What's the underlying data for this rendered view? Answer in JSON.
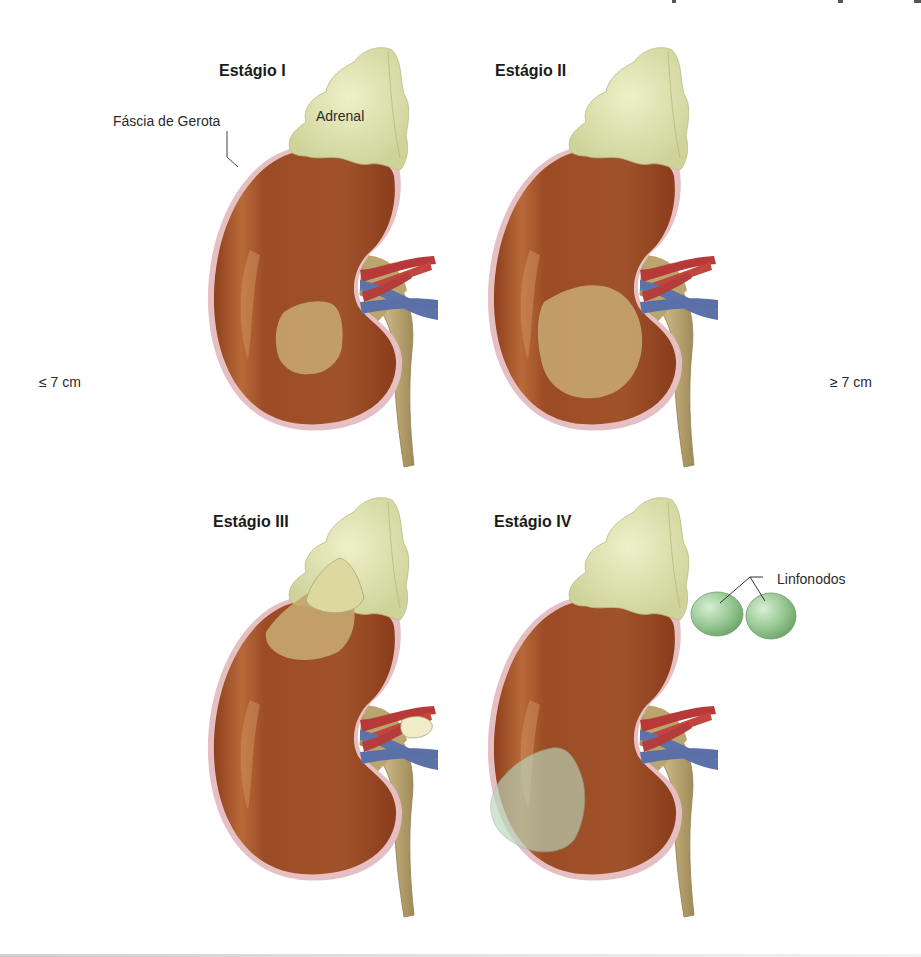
{
  "figure": {
    "topic": "Estadiamento do carcinoma de células renais",
    "panels": [
      {
        "id": "stage-1",
        "title": "Estágio I",
        "tumor": "small lower-pole tumor confined to kidney"
      },
      {
        "id": "stage-2",
        "title": "Estágio II",
        "tumor": "larger lower-pole tumor confined to kidney"
      },
      {
        "id": "stage-3",
        "title": "Estágio III",
        "tumor": "upper-pole tumor invading adrenal; renal vein thrombus"
      },
      {
        "id": "stage-4",
        "title": "Estágio IV",
        "tumor": "tumor extending beyond Gerota fascia; lymph node involvement"
      }
    ],
    "callouts": {
      "gerota": "Fáscia de Gerota",
      "adrenal": "Adrenal",
      "lymph_nodes": "Linfonodos"
    },
    "size_labels": {
      "left": "≤ 7 cm",
      "right": "≥ 7 cm"
    },
    "colors": {
      "kidney": "#9a4a22",
      "kidney_highlight": "#c07a4a",
      "capsule": "#e2b8bc",
      "adrenal": "#dfe2ae",
      "tumor": "#c9a874",
      "artery": "#b8393a",
      "vein": "#5d72a8",
      "ureter": "#b9a672",
      "lymph_node": "#9dcc9a",
      "extracapsular_tumor": "#c5dcc7"
    }
  }
}
